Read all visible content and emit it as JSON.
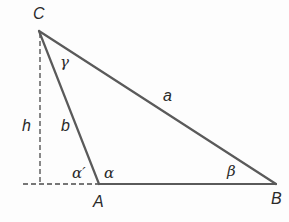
{
  "diagram": {
    "type": "triangle-with-altitude",
    "colors": {
      "line": "#5a5a5a",
      "dashed": "#4a4a4a",
      "text": "#2a2a2a",
      "background": "#fdfdfd"
    },
    "vertices": {
      "C": {
        "label": "C",
        "x": 39,
        "y": 31
      },
      "A": {
        "label": "A",
        "x": 99,
        "y": 184
      },
      "B": {
        "label": "B",
        "x": 276,
        "y": 184
      }
    },
    "sides": {
      "a": {
        "label": "a",
        "from": "C",
        "to": "B"
      },
      "b": {
        "label": "b",
        "from": "C",
        "to": "A"
      },
      "c": {
        "label": "",
        "from": "A",
        "to": "B"
      }
    },
    "altitude": {
      "label": "h",
      "foot": {
        "x": 40,
        "y": 184
      }
    },
    "extension": {
      "from_x": 23,
      "to_x": 99,
      "y": 184
    },
    "angles": {
      "gamma": {
        "label": "γ",
        "at": "C"
      },
      "alpha": {
        "label": "α",
        "at": "A"
      },
      "alpha_prime": {
        "label": "α′",
        "at": "A (exterior)"
      },
      "beta": {
        "label": "β",
        "at": "B"
      }
    }
  }
}
